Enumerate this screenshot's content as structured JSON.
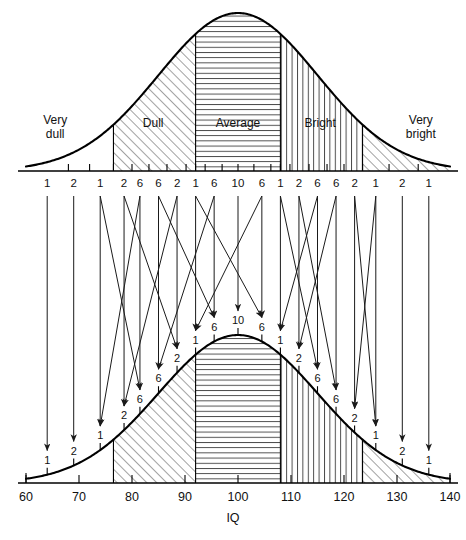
{
  "figure": {
    "title": "",
    "axis_label": "IQ"
  },
  "bands": [
    {
      "name": "very-dull",
      "label": "Very\ndull",
      "line1": "Very",
      "line2": "dull",
      "hatch": "none"
    },
    {
      "name": "dull",
      "label": "Dull",
      "line1": "Dull",
      "line2": "",
      "hatch": "diagonal"
    },
    {
      "name": "average",
      "label": "Average",
      "line1": "Average",
      "line2": "",
      "hatch": "horizontal"
    },
    {
      "name": "bright",
      "label": "Bright",
      "line1": "Bright",
      "line2": "",
      "hatch": "vertical"
    },
    {
      "name": "very-bright",
      "label": "Very\nbright",
      "line1": "Very",
      "line2": "bright",
      "hatch": "diagonal"
    }
  ],
  "top_chart": {
    "tick_labels": [
      "1",
      "2",
      "1",
      "2",
      "6",
      "6",
      "2",
      "1",
      "6",
      "10",
      "6",
      "1",
      "2",
      "6",
      "6",
      "2",
      "1",
      "2",
      "1"
    ],
    "band_labels": {
      "very_dull_l1": "Very",
      "very_dull_l2": "dull",
      "dull": "Dull",
      "average": "Average",
      "bright": "Bright",
      "very_bright_l1": "Very",
      "very_bright_l2": "bright"
    }
  },
  "bottom_chart": {
    "curve_labels": [
      "1",
      "2",
      "1",
      "2",
      "6",
      "6",
      "2",
      "1",
      "6",
      "10",
      "6",
      "1",
      "2",
      "6",
      "6",
      "2",
      "1",
      "2",
      "1"
    ],
    "axis_ticks": [
      "60",
      "70",
      "80",
      "90",
      "100",
      "110",
      "120",
      "130",
      "140"
    ],
    "axis_label": "IQ"
  },
  "chart_data": {
    "type": "area",
    "xlabel": "IQ",
    "ylabel": "",
    "xlim": [
      60,
      140
    ],
    "grid": false,
    "legend": "none",
    "distribution": {
      "mean": 100,
      "sd": 15,
      "kind": "normal"
    },
    "percent_labels": [
      1,
      2,
      1,
      2,
      6,
      6,
      2,
      1,
      6,
      10,
      6,
      1,
      2,
      6,
      6,
      2,
      1,
      2,
      1
    ],
    "percent_label_x": [
      64,
      69,
      74,
      78.5,
      81.5,
      85,
      88.5,
      92,
      95.5,
      100,
      104.5,
      108,
      111.5,
      115,
      118.5,
      122,
      126,
      131,
      136
    ],
    "band_boundaries": [
      60,
      76.5,
      92,
      108,
      123.5,
      140
    ],
    "band_names": [
      "Very dull",
      "Dull",
      "Average",
      "Bright",
      "Very bright"
    ],
    "band_hatching": [
      "none",
      "diagonal",
      "horizontal",
      "vertical",
      "diagonal"
    ],
    "axis_ticks_x": [
      60,
      70,
      80,
      90,
      100,
      110,
      120,
      130,
      140
    ]
  }
}
